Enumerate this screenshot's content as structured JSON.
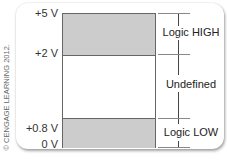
{
  "credit": "© CENGAGE LEARNING 2012.",
  "voltage_labels": [
    "+5 V",
    "+2 V",
    "+0.8 V",
    "0 V"
  ],
  "regions": [
    {
      "label": "Logic HIGH",
      "from": "+2 V",
      "to": "+5 V",
      "color": "#cccccc"
    },
    {
      "label": "Undefined",
      "from": "+0.8 V",
      "to": "+2 V",
      "color": "#ffffff"
    },
    {
      "label": "Logic LOW",
      "from": "0 V",
      "to": "+0.8 V",
      "color": "#cccccc"
    }
  ]
}
